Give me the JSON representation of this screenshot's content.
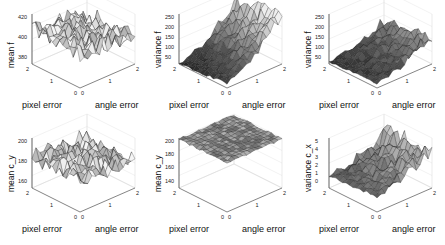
{
  "chart_data": [
    {
      "type": "surface",
      "panel": "top-left",
      "zlabel": "mean f",
      "xlabel": "pixel error",
      "ylabel": "angle error",
      "x_ticks": [
        "0",
        "1",
        "2"
      ],
      "y_ticks": [
        "0",
        "1",
        "2"
      ],
      "z_ticks": [
        "380",
        "400",
        "420"
      ],
      "zlim": [
        370,
        430
      ],
      "shade": "light",
      "profile": "flat-noisy",
      "base": 0.7,
      "rise": -0.15,
      "noise": 0.35
    },
    {
      "type": "surface",
      "panel": "top-middle",
      "zlabel": "variance f",
      "xlabel": "pixel error",
      "ylabel": "angle error",
      "x_ticks": [
        "0",
        "1",
        "2"
      ],
      "y_ticks": [
        "0",
        "1",
        "2"
      ],
      "z_ticks": [
        "50",
        "100",
        "150",
        "200",
        "250"
      ],
      "zlim": [
        0,
        270
      ],
      "shade": "dark-to-light",
      "profile": "rising",
      "base": 0.0,
      "rise": 0.75,
      "noise": 0.25
    },
    {
      "type": "surface",
      "panel": "top-right",
      "zlabel": "variance f",
      "xlabel": "pixel error",
      "ylabel": "angle error",
      "x_ticks": [
        "0",
        "1",
        "2"
      ],
      "y_ticks": [
        "0",
        "1",
        "2"
      ],
      "z_ticks": [
        "50",
        "100",
        "150",
        "200",
        "250"
      ],
      "zlim": [
        0,
        270
      ],
      "shade": "dark-to-light",
      "profile": "rising",
      "base": 0.05,
      "rise": 0.35,
      "noise": 0.2
    },
    {
      "type": "surface",
      "panel": "bottom-left",
      "zlabel": "mean c_y",
      "xlabel": "pixel error",
      "ylabel": "angle error",
      "x_ticks": [
        "0",
        "1",
        "2"
      ],
      "y_ticks": [
        "0",
        "1",
        "2"
      ],
      "z_ticks": [
        "160",
        "180",
        "200"
      ],
      "zlim": [
        150,
        210
      ],
      "shade": "light",
      "profile": "flat-noisy",
      "base": 0.65,
      "rise": -0.1,
      "noise": 0.35
    },
    {
      "type": "surface",
      "panel": "bottom-middle",
      "zlabel": "mean c_y",
      "xlabel": "pixel error",
      "ylabel": "angle error",
      "x_ticks": [
        "0",
        "1",
        "2"
      ],
      "y_ticks": [
        "0",
        "1",
        "2"
      ],
      "z_ticks": [
        "140",
        "160",
        "180",
        "200"
      ],
      "zlim": [
        140,
        200
      ],
      "shade": "mid",
      "profile": "flat",
      "base": 0.98,
      "rise": 0.0,
      "noise": 0.04
    },
    {
      "type": "surface",
      "panel": "bottom-right",
      "zlabel": "variance c_x",
      "xlabel": "pixel error",
      "ylabel": "angle error",
      "x_ticks": [
        "0",
        "1",
        "2"
      ],
      "y_ticks": [
        "0",
        "1",
        "2"
      ],
      "z_ticks": [
        "0",
        "1",
        "2",
        "3",
        "4",
        "5"
      ],
      "zlim": [
        0,
        5
      ],
      "shade": "dark-to-light",
      "profile": "rising",
      "base": 0.25,
      "rise": 0.4,
      "noise": 0.3
    }
  ],
  "labels": {
    "pixel": "pixel error",
    "angle": "angle error"
  },
  "panels": [
    {
      "zlabel": "mean f",
      "ticks": [
        "420",
        "400",
        "380"
      ]
    },
    {
      "zlabel": "variance f",
      "ticks": [
        "250",
        "200",
        "150",
        "100",
        "50"
      ]
    },
    {
      "zlabel": "variance f",
      "ticks": [
        "250",
        "200",
        "150",
        "100",
        "50"
      ]
    },
    {
      "zlabel": "mean c_y",
      "ticks": [
        "200",
        "180",
        "160"
      ]
    },
    {
      "zlabel": "mean c_y",
      "ticks": [
        "200",
        "180",
        "160",
        "140"
      ]
    },
    {
      "zlabel": "variance c_x",
      "ticks": [
        "5",
        "4",
        "3",
        "2",
        "1",
        "0"
      ]
    }
  ]
}
